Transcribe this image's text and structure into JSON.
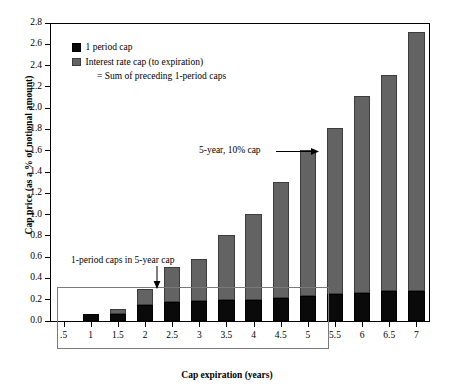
{
  "chart_data": {
    "type": "bar",
    "stacked": true,
    "title": "",
    "xlabel": "Cap expiration (years)",
    "ylabel": "Cap price (as a % of notional amount)",
    "ylim": [
      0.0,
      2.8
    ],
    "ytick_labels": [
      "0.0",
      "0.2",
      "0.4",
      "0.6",
      "0.8",
      "1.0",
      "1.2",
      "1.4",
      "1.6",
      "1.8",
      "2.0",
      "2.2",
      "2.4",
      "2.6",
      "2.8"
    ],
    "ytick_values": [
      0.0,
      0.2,
      0.4,
      0.6,
      0.8,
      1.0,
      1.2,
      1.4,
      1.6,
      1.8,
      2.0,
      2.2,
      2.4,
      2.6,
      2.8
    ],
    "grid": false,
    "legend_position": "upper-left",
    "categories": [
      ".5",
      "1",
      "1.5",
      "2",
      "2.5",
      "3",
      "3.5",
      "4",
      "4.5",
      "5",
      "5.5",
      "6",
      "6.5",
      "7"
    ],
    "series": [
      {
        "name": "1 period cap",
        "color": "#0a0a0a",
        "values": [
          0.0,
          0.07,
          0.07,
          0.155,
          0.175,
          0.19,
          0.195,
          0.2,
          0.215,
          0.235,
          0.255,
          0.265,
          0.28,
          0.285
        ]
      },
      {
        "name": "Interest rate cap (to expiration)",
        "color": "#636363",
        "values": [
          0.0,
          0.0,
          0.04,
          0.145,
          0.335,
          0.39,
          0.615,
          0.81,
          1.095,
          1.375,
          1.555,
          1.845,
          2.03,
          2.435
        ]
      }
    ],
    "totals": [
      0.0,
      0.07,
      0.11,
      0.3,
      0.51,
      0.58,
      0.81,
      1.01,
      1.31,
      1.61,
      1.81,
      2.11,
      2.31,
      2.72
    ],
    "annotations": [
      {
        "name": "five-year-cap",
        "text": "5-year, 10% cap",
        "points_to": "5"
      },
      {
        "name": "one-period-caps-box",
        "text": "1-period caps in 5-year cap",
        "points_to": "1.5"
      }
    ]
  },
  "legend": {
    "items": [
      {
        "label": "1 period cap",
        "swatch": "black"
      },
      {
        "label": "Interest rate cap (to expiration)",
        "swatch": "grey"
      }
    ],
    "sub_label": "= Sum of preceding 1-period caps"
  }
}
